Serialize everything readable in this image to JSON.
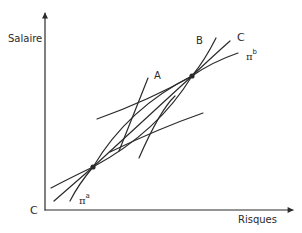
{
  "diagram": {
    "axes": {
      "y_label": "Salaire",
      "x_label": "Risques",
      "origin_label": "C"
    },
    "curve_labels": {
      "A": "A",
      "B": "B",
      "C": "C",
      "pi_a_symbol": "π",
      "pi_a_sup": "a",
      "pi_b_symbol": "π",
      "pi_b_sup": "b"
    },
    "points": [
      {
        "name": "lower-tangency",
        "x": 93,
        "y": 167
      },
      {
        "name": "upper-tangency",
        "x": 192,
        "y": 76
      }
    ],
    "colors": {
      "ink": "#2a2a2a",
      "background": "#ffffff"
    }
  }
}
